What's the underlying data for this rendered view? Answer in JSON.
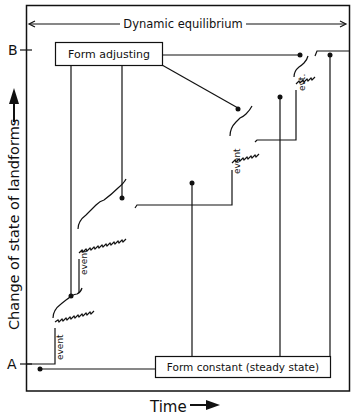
{
  "diagram": {
    "top_label": "Dynamic equilibrium",
    "y_axis_label": "Change of state of landforms",
    "x_axis_label": "Time",
    "level_top": "B",
    "level_bottom": "A",
    "box_top": "Form adjusting",
    "box_bottom": "Form constant (steady state)",
    "event_labels": [
      "event",
      "event",
      "event",
      "evt."
    ],
    "colors": {
      "ink": "#111111",
      "background": "#ffffff"
    }
  }
}
